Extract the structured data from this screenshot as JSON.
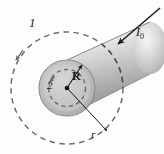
{
  "figure": {
    "type": "physics-diagram",
    "canvas": {
      "width": 164,
      "height": 154
    },
    "colors": {
      "background": "#fdfdfd",
      "ink": "#1a1a1a",
      "dashed_loop": "#6b6b6b",
      "cylinder_top_light": "#f1f1f1",
      "cylinder_mid": "#c9c9c9",
      "cylinder_dark": "#8e8e8e",
      "end_face_outer": "#b5b5b5",
      "end_face_inner": "#c6c6c6",
      "end_face_rim": "#9a9a9a"
    },
    "labels": {
      "loop_outer": "1",
      "loop_inner": "2",
      "radius_conductor": "R",
      "radius_loop": "r",
      "current": "I",
      "current_sub": "0"
    },
    "elements": {
      "cylinder": {
        "name": "current-carrying-cylinder",
        "orientation": "axis tilted up to the right",
        "shading": "linear gradient, light at top, dark at lower edge"
      },
      "end_face": {
        "name": "cylinder-end-face",
        "center_x": 67,
        "center_y": 88,
        "radius": 28
      },
      "loop_outer": {
        "name": "amperian-loop-1",
        "style": "dashed",
        "radius": 56,
        "direction": "counterclockwise",
        "note": "radius r, outside the conductor"
      },
      "loop_inner": {
        "name": "amperian-loop-2",
        "style": "dashed",
        "radius": 19,
        "direction": "counterclockwise",
        "note": "inside the conductor"
      },
      "radius_arrow_R": {
        "name": "radius-arrow-R",
        "from": "center",
        "to": "conductor surface",
        "direction": "up-right"
      },
      "radius_arrow_r": {
        "name": "radius-arrow-r",
        "from": "center",
        "to": "outer dashed loop",
        "direction": "down-right"
      },
      "current_arrow": {
        "name": "current-direction-arrow",
        "direction": "down-left into the cylinder",
        "label": "I0"
      }
    }
  }
}
